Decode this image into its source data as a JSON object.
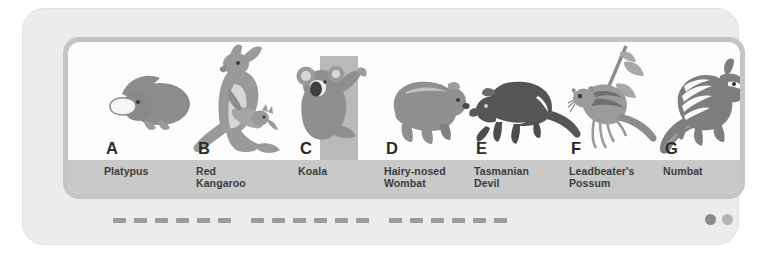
{
  "figure": {
    "panel_background": "#fdfdfd",
    "frame_color": "#c5c5c5",
    "card_color": "#ececec",
    "label_band_color": "#c9c9c9",
    "species": [
      {
        "letter": "A",
        "name": "Platypus",
        "icon": "platypus-illustration",
        "body_color": "#8d8d8d",
        "accent_color": "#f2f2f2"
      },
      {
        "letter": "B",
        "name": "Red\nKangaroo",
        "icon": "red-kangaroo-illustration",
        "body_color": "#9a9a9a",
        "accent_color": "#d6d6d6"
      },
      {
        "letter": "C",
        "name": "Koala",
        "icon": "koala-illustration",
        "body_color": "#8f8f8f",
        "accent_color": "#b9b9b9"
      },
      {
        "letter": "D",
        "name": "Hairy-nosed\nWombat",
        "icon": "hairy-nosed-wombat-illustration",
        "body_color": "#8f8f8f",
        "accent_color": "#c2c2c2"
      },
      {
        "letter": "E",
        "name": "Tasmanian\nDevil",
        "icon": "tasmanian-devil-illustration",
        "body_color": "#555555",
        "accent_color": "#fafafa"
      },
      {
        "letter": "F",
        "name": "Leadbeater's\nPossum",
        "icon": "leadbeaters-possum-illustration",
        "body_color": "#9b9b9b",
        "accent_color": "#6f6f6f"
      },
      {
        "letter": "G",
        "name": "Numbat",
        "icon": "numbat-illustration",
        "body_color": "#7e7e7e",
        "accent_color": "#fbfbfb"
      }
    ]
  },
  "caption": {
    "dash_color": "#9b9b9b",
    "dash_groups": [
      6,
      6,
      6
    ]
  },
  "page_dots": [
    {
      "name": "page-dot-active",
      "color": "#8a8a8a"
    },
    {
      "name": "page-dot-inactive",
      "color": "#b3b3b3"
    }
  ]
}
